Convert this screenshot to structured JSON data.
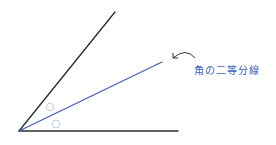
{
  "diagram": {
    "title": "角の二等分線",
    "label": "角の二等分線",
    "colors": {
      "ray": "#2a2a2a",
      "bisector": "#3a5fb8",
      "angle_mark": "#b8c4de",
      "label": "#3a5fb8",
      "arrow": "#333333"
    },
    "vertex": [
      19,
      131
    ],
    "rays": [
      {
        "name": "upper-ray",
        "end": [
          115,
          12
        ]
      },
      {
        "name": "bottom-ray",
        "end": [
          178,
          131
        ]
      }
    ],
    "bisector": {
      "end": [
        162,
        62
      ]
    },
    "angle_marks": [
      {
        "symbol": "○",
        "center": [
          50,
          107
        ]
      },
      {
        "symbol": "○",
        "center": [
          56,
          124
        ]
      }
    ]
  }
}
